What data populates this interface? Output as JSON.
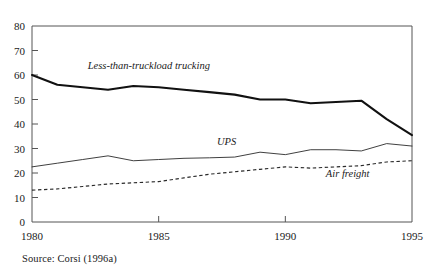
{
  "chart_data": {
    "type": "line",
    "title": "",
    "subtitle": "",
    "xlabel": "",
    "ylabel": "",
    "xlim": [
      1980,
      1995
    ],
    "ylim": [
      0,
      80
    ],
    "grid": false,
    "legend_position": "inline-annotations",
    "x": [
      1980,
      1981,
      1982,
      1983,
      1984,
      1985,
      1986,
      1987,
      1988,
      1989,
      1990,
      1991,
      1992,
      1993,
      1994,
      1995
    ],
    "xticks": [
      1980,
      1985,
      1990,
      1995
    ],
    "xtick_labels": [
      "1980",
      "1985",
      "1990",
      "1995"
    ],
    "yticks": [
      0,
      10,
      20,
      30,
      40,
      50,
      60,
      70,
      80
    ],
    "ytick_labels": [
      "0",
      "10",
      "20",
      "30",
      "40",
      "50",
      "60",
      "70",
      "80"
    ],
    "series": [
      {
        "name": "Less-than-truckload trucking",
        "style": "solid-thick",
        "color": "#111111",
        "label_x": 1982.2,
        "label_y": 62.5,
        "values": [
          60,
          56,
          55,
          54,
          55.5,
          55,
          54,
          53,
          52,
          50,
          50,
          48.5,
          49,
          49.5,
          42,
          35.5
        ]
      },
      {
        "name": "UPS",
        "style": "solid-thin",
        "color": "#2a2a2a",
        "label_x": 1987.3,
        "label_y": 31.5,
        "values": [
          22.5,
          24,
          25.5,
          27,
          25,
          25.5,
          26,
          26.2,
          26.5,
          28.5,
          27.5,
          29.5,
          29.5,
          29,
          32,
          31
        ]
      },
      {
        "name": "Air freight",
        "style": "dashed",
        "color": "#2a2a2a",
        "label_x": 1991.6,
        "label_y": 18.3,
        "values": [
          13,
          13.5,
          14.5,
          15.5,
          16,
          16.5,
          18,
          19.5,
          20.5,
          21.5,
          22.5,
          22,
          22.5,
          23,
          24.5,
          25
        ]
      }
    ]
  },
  "annotations": {
    "source": "Source: Corsi (1996a)"
  }
}
